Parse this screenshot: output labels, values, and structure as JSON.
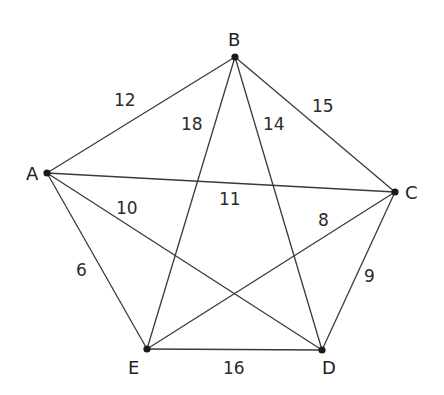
{
  "diagram": {
    "type": "weighted-complete-graph",
    "nodes": [
      {
        "id": "A",
        "label": "A",
        "x": 47,
        "y": 173,
        "lx": 26,
        "ly": 180
      },
      {
        "id": "B",
        "label": "B",
        "x": 235,
        "y": 57,
        "lx": 228,
        "ly": 46
      },
      {
        "id": "C",
        "label": "C",
        "x": 395,
        "y": 192,
        "lx": 405,
        "ly": 199
      },
      {
        "id": "D",
        "label": "D",
        "x": 322,
        "y": 350,
        "lx": 322,
        "ly": 374
      },
      {
        "id": "E",
        "label": "E",
        "x": 147,
        "y": 349,
        "lx": 128,
        "ly": 374
      }
    ],
    "edges": [
      {
        "from": "A",
        "to": "B",
        "weight": "12",
        "lx": 114,
        "ly": 106
      },
      {
        "from": "A",
        "to": "C",
        "weight": "11",
        "lx": 219,
        "ly": 205
      },
      {
        "from": "A",
        "to": "D",
        "weight": "10",
        "lx": 116,
        "ly": 214
      },
      {
        "from": "A",
        "to": "E",
        "weight": "6",
        "lx": 76,
        "ly": 276
      },
      {
        "from": "B",
        "to": "C",
        "weight": "15",
        "lx": 312,
        "ly": 112
      },
      {
        "from": "B",
        "to": "D",
        "weight": "14",
        "lx": 263,
        "ly": 130
      },
      {
        "from": "B",
        "to": "E",
        "weight": "18",
        "lx": 181,
        "ly": 130
      },
      {
        "from": "C",
        "to": "D",
        "weight": "9",
        "lx": 364,
        "ly": 282
      },
      {
        "from": "C",
        "to": "E",
        "weight": "8",
        "lx": 318,
        "ly": 226
      },
      {
        "from": "D",
        "to": "E",
        "weight": "16",
        "lx": 223,
        "ly": 374
      }
    ]
  }
}
